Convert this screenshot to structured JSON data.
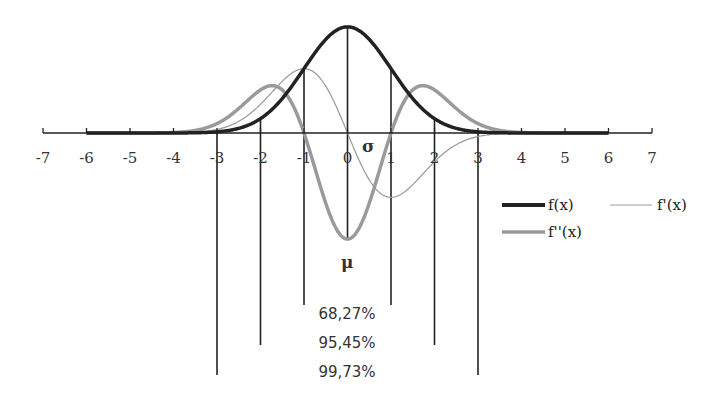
{
  "chart_data": {
    "type": "line",
    "title": "",
    "xlabel": "",
    "ylabel": "",
    "xlim": [
      -7,
      7
    ],
    "x_ticks": [
      -7,
      -6,
      -5,
      -4,
      -3,
      -2,
      -1,
      0,
      1,
      2,
      3,
      4,
      5,
      6,
      7
    ],
    "x_tick_labels": [
      "-7",
      "-6",
      "-5",
      "-4",
      "-3",
      "-2",
      "-1",
      "0",
      "1",
      "2",
      "3",
      "4",
      "5",
      "6",
      "7"
    ],
    "curve_domain": [
      -6,
      6
    ],
    "series": [
      {
        "name": "f(x)",
        "formula": "standard normal pdf",
        "color": "#222222",
        "weight": "thick"
      },
      {
        "name": "f'(x)",
        "formula": "first derivative of pdf",
        "color": "#999999",
        "weight": "thin"
      },
      {
        "name": "f''(x)",
        "formula": "second derivative of pdf",
        "color": "#9a9a9a",
        "weight": "medium"
      }
    ],
    "annotations": {
      "mu": "μ",
      "sigma": "σ",
      "percentages": [
        "68,27%",
        "95,45%",
        "99,73%"
      ],
      "sigma_lines": [
        1,
        2,
        3
      ]
    },
    "legend": {
      "placement": "right",
      "items": [
        "f(x)",
        "f'(x)",
        "f''(x)"
      ]
    },
    "grid": false
  }
}
